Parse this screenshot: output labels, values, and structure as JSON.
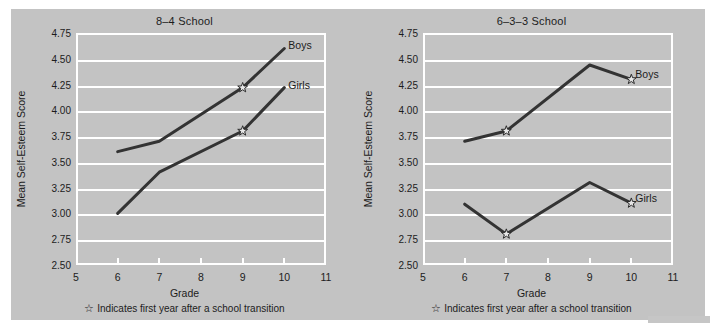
{
  "axis": {
    "ylabel": "Mean Self-Esteem Score",
    "xlabel": "Grade",
    "yticks": [
      "4.75",
      "4.50",
      "4.25",
      "4.00",
      "3.75",
      "3.50",
      "3.25",
      "3.00",
      "2.75",
      "2.50"
    ],
    "xticks": [
      "5",
      "6",
      "7",
      "8",
      "9",
      "10",
      "11"
    ]
  },
  "note": {
    "star_glyph": "☆",
    "text": "Indicates first year after a school transition"
  },
  "labels": {
    "boys": "Boys",
    "girls": "Girls"
  },
  "colors": {
    "panel_background": "#c3c3c3",
    "gridline": "#ffffff",
    "line": "#333333",
    "text": "#1c1c1c",
    "page_background": "#ffffff"
  },
  "chart_data": [
    {
      "type": "line",
      "title": "8–4 School",
      "xlabel": "Grade",
      "ylabel": "Mean Self-Esteem Score",
      "xlim": [
        5,
        11
      ],
      "ylim": [
        2.5,
        4.75
      ],
      "ytick_step": 0.25,
      "grid": true,
      "legend": "inline-right",
      "x": [
        6,
        7,
        9,
        10
      ],
      "series": [
        {
          "name": "Boys",
          "values": [
            3.6,
            3.7,
            4.22,
            4.6
          ],
          "transition_markers": [
            9
          ]
        },
        {
          "name": "Girls",
          "values": [
            3.0,
            3.4,
            3.8,
            4.22
          ],
          "transition_markers": [
            9
          ]
        }
      ]
    },
    {
      "type": "line",
      "title": "6–3–3 School",
      "xlabel": "Grade",
      "ylabel": "Mean Self-Esteem Score",
      "xlim": [
        5,
        11
      ],
      "ylim": [
        2.5,
        4.75
      ],
      "ytick_step": 0.25,
      "grid": true,
      "legend": "inline-right",
      "x": [
        6,
        7,
        9,
        10
      ],
      "series": [
        {
          "name": "Boys",
          "values": [
            3.7,
            3.8,
            4.44,
            4.3
          ],
          "transition_markers": [
            7,
            10
          ]
        },
        {
          "name": "Girls",
          "values": [
            3.09,
            2.8,
            3.3,
            3.1
          ],
          "transition_markers": [
            7,
            10
          ]
        }
      ]
    }
  ]
}
